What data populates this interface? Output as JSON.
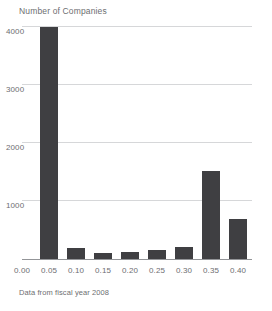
{
  "chart_data": {
    "type": "bar",
    "title": "Number of Companies",
    "caption": "Data from fiscal year 2008",
    "xlabel": "",
    "ylabel": "Number of Companies",
    "categories": [
      "0.05",
      "0.10",
      "0.15",
      "0.20",
      "0.25",
      "0.30",
      "0.35",
      "0.40"
    ],
    "values": [
      4000,
      190,
      100,
      120,
      150,
      210,
      1520,
      690
    ],
    "x_ticks": [
      "0.00",
      "0.05",
      "0.10",
      "0.15",
      "0.20",
      "0.25",
      "0.30",
      "0.35",
      "0.40"
    ],
    "y_ticks": [
      "1000",
      "2000",
      "3000",
      "4000"
    ],
    "y_tick_values": [
      1000,
      2000,
      3000,
      4000
    ],
    "xlim": [
      0.0,
      0.425
    ],
    "ylim": [
      0,
      4025
    ],
    "grid": "horizontal",
    "legend": "none",
    "bar_color": "#3f3f42",
    "grid_color": "#d6d7d9",
    "axis_color": "#939598",
    "text_color": "#6d6e71"
  }
}
